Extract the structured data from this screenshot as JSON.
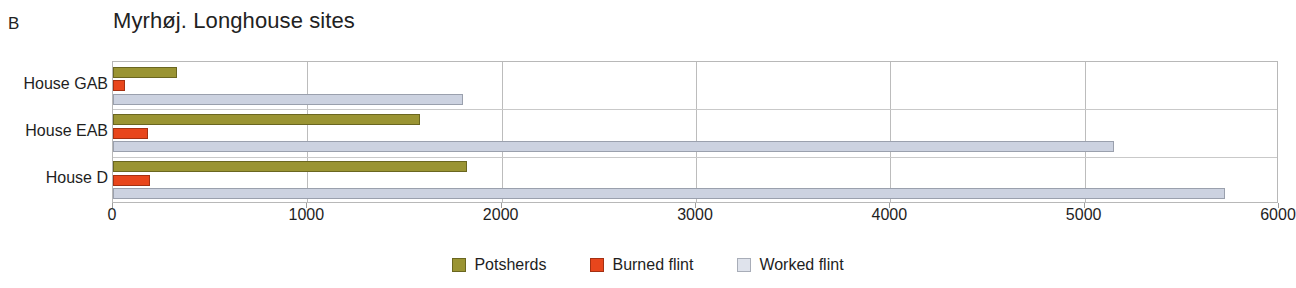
{
  "panel": {
    "label": "B"
  },
  "chart_data": {
    "type": "bar",
    "orientation": "horizontal",
    "title": "Myrhøj. Longhouse sites",
    "xlabel": "",
    "ylabel": "",
    "categories": [
      "House GAB",
      "House EAB",
      "House D"
    ],
    "series": [
      {
        "name": "Potsherds",
        "color": "#9a9433",
        "values": [
          330,
          1580,
          1820
        ]
      },
      {
        "name": "Burned flint",
        "color": "#e8461c",
        "values": [
          60,
          180,
          190
        ]
      },
      {
        "name": "Worked flint",
        "color": "#dfe3ec",
        "values": [
          1800,
          5150,
          5720
        ]
      }
    ],
    "xlim": [
      0,
      6000
    ],
    "xticks": [
      0,
      1000,
      2000,
      3000,
      4000,
      5000,
      6000
    ],
    "xtick_labels": [
      "0",
      "1000",
      "2000",
      "3000",
      "4000",
      "5000",
      "6000"
    ],
    "grid": "vertical",
    "legend_position": "bottom"
  }
}
